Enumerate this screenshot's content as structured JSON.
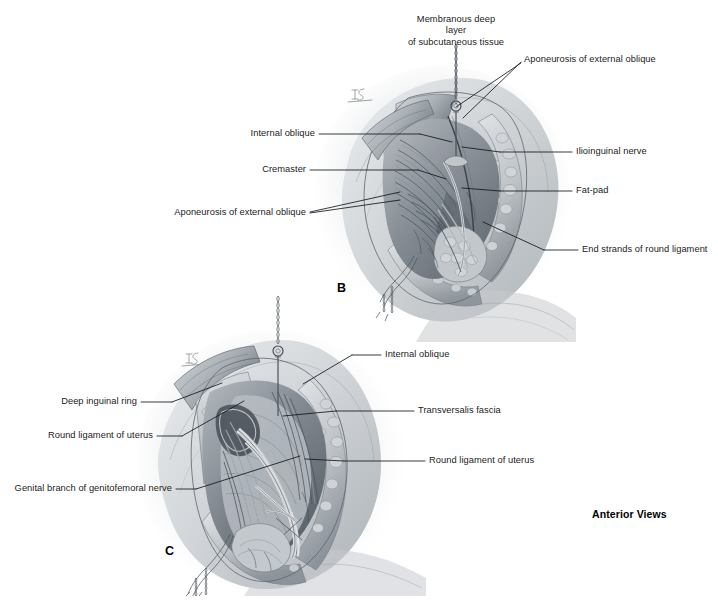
{
  "figure": {
    "title_note": "Anterior Views",
    "panels": [
      {
        "letter": "B",
        "labels": [
          {
            "text_line1": "Membranous deep layer",
            "text_line2": "of subcutaneous tissue",
            "side": "top"
          },
          {
            "text_line1": "Aponeurosis of external oblique",
            "side": "top-right"
          },
          {
            "text_line1": "Internal oblique",
            "side": "left"
          },
          {
            "text_line1": "Cremaster",
            "side": "left"
          },
          {
            "text_line1": "Aponeurosis of external oblique",
            "side": "left"
          },
          {
            "text_line1": "Ilioinguinal nerve",
            "side": "right"
          },
          {
            "text_line1": "Fat-pad",
            "side": "right"
          },
          {
            "text_line1": "End strands of round ligament",
            "side": "right"
          }
        ]
      },
      {
        "letter": "C",
        "labels": [
          {
            "text_line1": "Internal oblique",
            "side": "right"
          },
          {
            "text_line1": "Transversalis fascia",
            "side": "right"
          },
          {
            "text_line1": "Round ligament of uterus",
            "side": "right"
          },
          {
            "text_line1": "Deep inguinal ring",
            "side": "left"
          },
          {
            "text_line1": "Round ligament of uterus",
            "side": "left"
          },
          {
            "text_line1": "Genital branch of genitofemoral nerve",
            "side": "left"
          }
        ]
      }
    ]
  },
  "panel_b": {
    "letter": "B",
    "label_membranous_l1": "Membranous deep layer",
    "label_membranous_l2": "of subcutaneous tissue",
    "label_aponeurosis_top": "Aponeurosis of external oblique",
    "label_internal_oblique": "Internal oblique",
    "label_cremaster": "Cremaster",
    "label_aponeurosis_left": "Aponeurosis of external oblique",
    "label_ilioinguinal": "Ilioinguinal nerve",
    "label_fatpad": "Fat-pad",
    "label_end_strands": "End strands of round ligament"
  },
  "panel_c": {
    "letter": "C",
    "label_internal_oblique": "Internal oblique",
    "label_transversalis": "Transversalis fascia",
    "label_round_lig_right": "Round ligament of uterus",
    "label_deep_ring": "Deep inguinal ring",
    "label_round_lig_left": "Round ligament of uterus",
    "label_genital_branch": "Genital branch of genitofemoral nerve"
  },
  "footer": {
    "anterior_views": "Anterior Views"
  },
  "colors": {
    "background": "#ffffff",
    "text": "#1c1c1c",
    "leader_line": "#14181c",
    "illustration_mid": "#9aa0a6",
    "illustration_dark": "#3b4148",
    "illustration_light": "#d8dadd"
  }
}
